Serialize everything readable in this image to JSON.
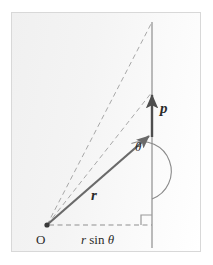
{
  "figure": {
    "background_color": "#f4f4f4",
    "frame_color": "#d8d8d8",
    "ink_color": "#5a5a5a",
    "label_color": "#2b2b2b"
  },
  "labels": {
    "momentum_vector": "p",
    "position_vector": "r",
    "angle": "θ",
    "origin": "O",
    "moment_arm_prefix": "r",
    "moment_arm_sin": "sin",
    "moment_arm_angle": "θ",
    "moment_arm": "r sin θ"
  },
  "geometry": {
    "origin_point": {
      "x": 47,
      "y": 225
    },
    "vertical_line": {
      "x": 152,
      "y_top": 22,
      "y_bottom": 248
    },
    "r_vector": {
      "x1": 47,
      "y1": 225,
      "x2": 152,
      "y2": 133
    },
    "p_vector": {
      "x1": 152,
      "y1": 137,
      "x2": 152,
      "y2": 92
    },
    "dashed_line_upper": {
      "x1": 47,
      "y1": 225,
      "x2": 152,
      "y2": 22
    },
    "dashed_line_lower": {
      "x1": 47,
      "y1": 225,
      "x2": 152,
      "y2": 92
    },
    "moment_arm_dashed": {
      "x1": 47,
      "y1": 225,
      "x2": 152,
      "y2": 225
    },
    "right_angle_marker": {
      "x": 152,
      "y": 225,
      "size": 10
    },
    "angle_arc_radius": 26
  }
}
